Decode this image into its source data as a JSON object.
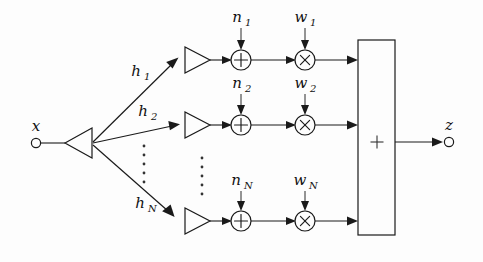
{
  "figure": {
    "background_color": "#fdfdfd",
    "line_color": "#1a1a1a",
    "text_color": "#111111"
  },
  "input": {
    "label": "x",
    "terminal": "open-circle"
  },
  "output": {
    "label": "z",
    "terminal": "open-circle"
  },
  "combiner": {
    "glyph": "+",
    "shape": "rectangle"
  },
  "branches": [
    {
      "id": "branch-1",
      "channel_label": "h",
      "channel_sub": "1",
      "noise_label": "n",
      "noise_sub": "1",
      "weight_label": "w",
      "weight_sub": "1",
      "adder_glyph": "+",
      "multiplier_glyph": "×"
    },
    {
      "id": "branch-2",
      "channel_label": "h",
      "channel_sub": "2",
      "noise_label": "n",
      "noise_sub": "2",
      "weight_label": "w",
      "weight_sub": "2",
      "adder_glyph": "+",
      "multiplier_glyph": "×"
    },
    {
      "id": "branch-N",
      "channel_label": "h",
      "channel_sub": "N",
      "noise_label": "n",
      "noise_sub": "N",
      "weight_label": "w",
      "weight_sub": "N",
      "adder_glyph": "+",
      "multiplier_glyph": "×"
    }
  ],
  "ellipsis": {
    "glyph": "⋮",
    "count": 2
  }
}
